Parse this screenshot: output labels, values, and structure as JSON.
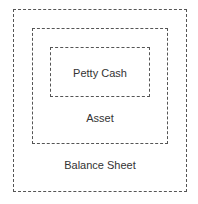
{
  "diagram": {
    "outer": {
      "label": "Balance Sheet"
    },
    "middle": {
      "label": "Asset"
    },
    "inner": {
      "label": "Petty Cash"
    }
  }
}
